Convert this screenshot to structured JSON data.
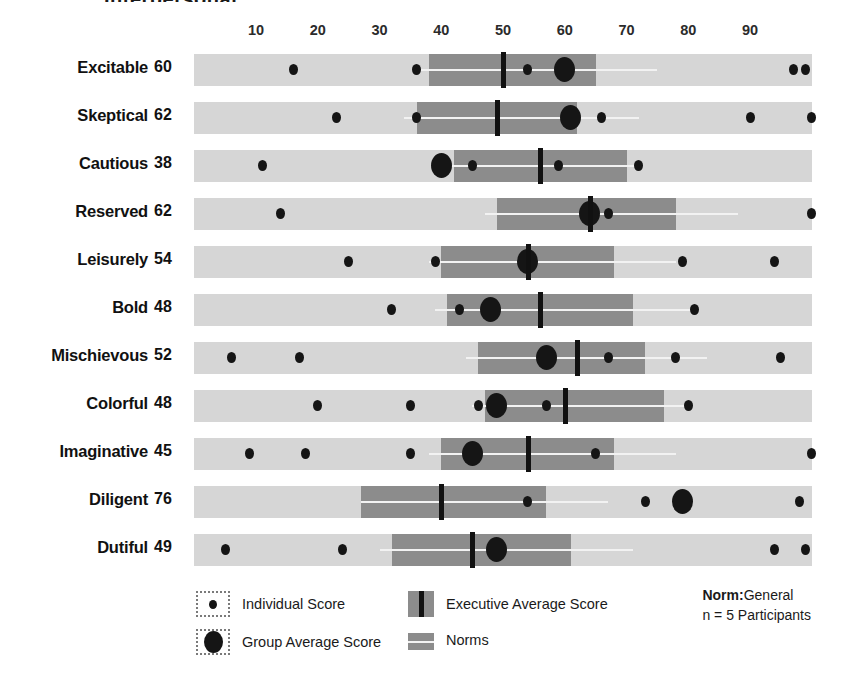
{
  "header": {
    "title_remnant": "Interpersonal"
  },
  "legend": {
    "individual_label": "Individual Score",
    "group_label": "Group Average Score",
    "executive_label": "Executive Average Score",
    "norms_label": "Norms",
    "norm_title": "Norm:",
    "norm_value": "General",
    "participants": "n = 5 Participants"
  },
  "colors": {
    "norm_band": "#d6d6d6",
    "exec_band": "#8c8c8c",
    "marker": "#151515",
    "midline": "#f2f2f2",
    "text": "#1a1a1a"
  },
  "chart_data": {
    "type": "bar",
    "title": "Interpersonal",
    "xlabel": "",
    "ylabel": "",
    "xlim": [
      0,
      100
    ],
    "ticks": [
      10,
      20,
      30,
      40,
      50,
      60,
      70,
      80,
      90
    ],
    "grid": false,
    "legend_position": "bottom",
    "norm_group": "General",
    "participants": 5,
    "categories": [
      "Excitable",
      "Skeptical",
      "Cautious",
      "Reserved",
      "Leisurely",
      "Bold",
      "Mischievous",
      "Colorful",
      "Imaginative",
      "Diligent",
      "Dutiful"
    ],
    "values": [
      60,
      62,
      38,
      62,
      54,
      48,
      52,
      48,
      45,
      76,
      49
    ],
    "rows": [
      {
        "label": "Excitable",
        "score": 60,
        "norm_range": [
          0,
          100
        ],
        "exec_band": [
          38,
          65
        ],
        "exec_average": 50,
        "group_average": 60,
        "individual_scores": [
          16,
          36,
          54,
          60,
          97,
          99
        ]
      },
      {
        "label": "Skeptical",
        "score": 62,
        "norm_range": [
          0,
          100
        ],
        "exec_band": [
          36,
          62
        ],
        "exec_average": 49,
        "group_average": 61,
        "individual_scores": [
          23,
          36,
          61,
          66,
          90,
          100
        ]
      },
      {
        "label": "Cautious",
        "score": 38,
        "norm_range": [
          0,
          100
        ],
        "exec_band": [
          42,
          70
        ],
        "exec_average": 56,
        "group_average": 40,
        "individual_scores": [
          11,
          40,
          45,
          59,
          72
        ]
      },
      {
        "label": "Reserved",
        "score": 62,
        "norm_range": [
          0,
          100
        ],
        "exec_band": [
          49,
          78
        ],
        "exec_average": 64,
        "group_average": 64,
        "individual_scores": [
          14,
          64,
          67,
          100
        ]
      },
      {
        "label": "Leisurely",
        "score": 54,
        "norm_range": [
          0,
          100
        ],
        "exec_band": [
          40,
          68
        ],
        "exec_average": 54,
        "group_average": 54,
        "individual_scores": [
          25,
          39,
          54,
          79,
          94
        ]
      },
      {
        "label": "Bold",
        "score": 48,
        "norm_range": [
          0,
          100
        ],
        "exec_band": [
          41,
          71
        ],
        "exec_average": 56,
        "group_average": 48,
        "individual_scores": [
          32,
          43,
          48,
          81
        ]
      },
      {
        "label": "Mischievous",
        "score": 52,
        "norm_range": [
          0,
          100
        ],
        "exec_band": [
          46,
          73
        ],
        "exec_average": 62,
        "group_average": 57,
        "individual_scores": [
          6,
          17,
          57,
          67,
          78,
          95
        ]
      },
      {
        "label": "Colorful",
        "score": 48,
        "norm_range": [
          0,
          100
        ],
        "exec_band": [
          47,
          76
        ],
        "exec_average": 60,
        "group_average": 49,
        "individual_scores": [
          20,
          35,
          46,
          49,
          57,
          80
        ]
      },
      {
        "label": "Imaginative",
        "score": 45,
        "norm_range": [
          0,
          100
        ],
        "exec_band": [
          40,
          68
        ],
        "exec_average": 54,
        "group_average": 45,
        "individual_scores": [
          9,
          18,
          35,
          45,
          65,
          100
        ]
      },
      {
        "label": "Diligent",
        "score": 76,
        "norm_range": [
          0,
          100
        ],
        "exec_band": [
          27,
          57
        ],
        "exec_average": 40,
        "group_average": 79,
        "individual_scores": [
          54,
          73,
          79,
          98
        ]
      },
      {
        "label": "Dutiful",
        "score": 49,
        "norm_range": [
          0,
          100
        ],
        "exec_band": [
          32,
          61
        ],
        "exec_average": 45,
        "group_average": 49,
        "individual_scores": [
          5,
          24,
          49,
          94,
          99
        ]
      }
    ]
  }
}
